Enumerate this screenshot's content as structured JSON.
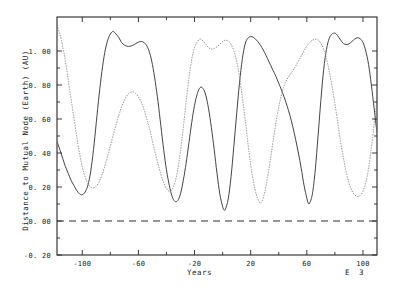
{
  "chart_data": {
    "type": "line",
    "title": "",
    "xlabel": "Years",
    "ylabel": "Distance to Mutual Node (Earth) (AU)",
    "x_exponent_label": "E  3",
    "xlim": [
      -118,
      110
    ],
    "ylim": [
      -0.2,
      1.2
    ],
    "xticks": [
      -100,
      -60,
      -20,
      20,
      60,
      100
    ],
    "xtick_labels": [
      "-100",
      "-60",
      "-20",
      "20",
      "60",
      "100"
    ],
    "yticks": [
      1.0,
      0.8,
      0.6,
      0.4,
      0.2,
      0.0,
      -0.2
    ],
    "ytick_labels": [
      "1. 00",
      "0. 80",
      "0. 60",
      "0. 40",
      "0. 20",
      "0. 00",
      "-0. 20"
    ],
    "grid": false,
    "legend": null,
    "reference_lines": [
      {
        "name": "zero-line",
        "axis": "horizontal",
        "value": 0.0,
        "style": "dashed"
      }
    ],
    "series": [
      {
        "name": "solid-curve",
        "style": "solid",
        "color": "#3a3a3a",
        "points": [
          [
            -118,
            0.47
          ],
          [
            -116,
            0.42
          ],
          [
            -114,
            0.37
          ],
          [
            -112,
            0.32
          ],
          [
            -110,
            0.28
          ],
          [
            -108,
            0.24
          ],
          [
            -106,
            0.21
          ],
          [
            -104,
            0.18
          ],
          [
            -102,
            0.16
          ],
          [
            -100,
            0.155
          ],
          [
            -98,
            0.17
          ],
          [
            -96,
            0.21
          ],
          [
            -94,
            0.29
          ],
          [
            -92,
            0.42
          ],
          [
            -90,
            0.58
          ],
          [
            -88,
            0.74
          ],
          [
            -86,
            0.88
          ],
          [
            -84,
            0.99
          ],
          [
            -82,
            1.06
          ],
          [
            -80,
            1.1
          ],
          [
            -78,
            1.115
          ],
          [
            -76,
            1.1
          ],
          [
            -74,
            1.08
          ],
          [
            -72,
            1.05
          ],
          [
            -70,
            1.035
          ],
          [
            -68,
            1.028
          ],
          [
            -66,
            1.028
          ],
          [
            -64,
            1.033
          ],
          [
            -62,
            1.043
          ],
          [
            -60,
            1.052
          ],
          [
            -58,
            1.056
          ],
          [
            -56,
            1.05
          ],
          [
            -54,
            1.03
          ],
          [
            -52,
            0.99
          ],
          [
            -50,
            0.92
          ],
          [
            -48,
            0.82
          ],
          [
            -46,
            0.7
          ],
          [
            -44,
            0.56
          ],
          [
            -42,
            0.42
          ],
          [
            -40,
            0.3
          ],
          [
            -38,
            0.21
          ],
          [
            -36,
            0.145
          ],
          [
            -34,
            0.115
          ],
          [
            -32,
            0.12
          ],
          [
            -30,
            0.16
          ],
          [
            -28,
            0.24
          ],
          [
            -26,
            0.34
          ],
          [
            -24,
            0.46
          ],
          [
            -22,
            0.58
          ],
          [
            -20,
            0.68
          ],
          [
            -18,
            0.75
          ],
          [
            -16,
            0.785
          ],
          [
            -14,
            0.78
          ],
          [
            -12,
            0.74
          ],
          [
            -10,
            0.66
          ],
          [
            -8,
            0.55
          ],
          [
            -6,
            0.42
          ],
          [
            -4,
            0.28
          ],
          [
            -2,
            0.16
          ],
          [
            0,
            0.085
          ],
          [
            1,
            0.065
          ],
          [
            2,
            0.07
          ],
          [
            4,
            0.13
          ],
          [
            6,
            0.26
          ],
          [
            8,
            0.44
          ],
          [
            10,
            0.63
          ],
          [
            12,
            0.81
          ],
          [
            14,
            0.95
          ],
          [
            16,
            1.04
          ],
          [
            18,
            1.075
          ],
          [
            20,
            1.085
          ],
          [
            22,
            1.08
          ],
          [
            24,
            1.065
          ],
          [
            26,
            1.045
          ],
          [
            28,
            1.02
          ],
          [
            30,
            0.99
          ],
          [
            32,
            0.955
          ],
          [
            34,
            0.92
          ],
          [
            36,
            0.885
          ],
          [
            38,
            0.85
          ],
          [
            40,
            0.81
          ],
          [
            42,
            0.77
          ],
          [
            44,
            0.725
          ],
          [
            46,
            0.675
          ],
          [
            48,
            0.62
          ],
          [
            50,
            0.555
          ],
          [
            52,
            0.48
          ],
          [
            54,
            0.4
          ],
          [
            56,
            0.31
          ],
          [
            58,
            0.21
          ],
          [
            60,
            0.135
          ],
          [
            61,
            0.105
          ],
          [
            62,
            0.105
          ],
          [
            64,
            0.16
          ],
          [
            66,
            0.3
          ],
          [
            68,
            0.5
          ],
          [
            70,
            0.71
          ],
          [
            72,
            0.89
          ],
          [
            74,
            1.01
          ],
          [
            76,
            1.075
          ],
          [
            78,
            1.1
          ],
          [
            80,
            1.105
          ],
          [
            82,
            1.09
          ],
          [
            84,
            1.065
          ],
          [
            86,
            1.045
          ],
          [
            88,
            1.038
          ],
          [
            90,
            1.042
          ],
          [
            92,
            1.055
          ],
          [
            94,
            1.07
          ],
          [
            96,
            1.078
          ],
          [
            98,
            1.072
          ],
          [
            100,
            1.05
          ],
          [
            102,
            1.0
          ],
          [
            104,
            0.92
          ],
          [
            106,
            0.8
          ],
          [
            108,
            0.66
          ],
          [
            110,
            0.52
          ],
          [
            112,
            0.4
          ],
          [
            114,
            0.3
          ],
          [
            116,
            0.235
          ],
          [
            118,
            0.2
          ],
          [
            120,
            0.195
          ]
        ]
      },
      {
        "name": "dotted-curve",
        "style": "dotted",
        "color": "#8c8c8c",
        "points": [
          [
            -118,
            1.15
          ],
          [
            -116,
            1.1
          ],
          [
            -114,
            1.03
          ],
          [
            -112,
            0.94
          ],
          [
            -110,
            0.83
          ],
          [
            -108,
            0.72
          ],
          [
            -106,
            0.61
          ],
          [
            -104,
            0.5
          ],
          [
            -102,
            0.4
          ],
          [
            -100,
            0.32
          ],
          [
            -98,
            0.26
          ],
          [
            -96,
            0.22
          ],
          [
            -94,
            0.2
          ],
          [
            -92,
            0.195
          ],
          [
            -90,
            0.205
          ],
          [
            -88,
            0.23
          ],
          [
            -86,
            0.27
          ],
          [
            -84,
            0.32
          ],
          [
            -82,
            0.38
          ],
          [
            -80,
            0.44
          ],
          [
            -78,
            0.505
          ],
          [
            -76,
            0.565
          ],
          [
            -74,
            0.62
          ],
          [
            -72,
            0.67
          ],
          [
            -70,
            0.71
          ],
          [
            -68,
            0.74
          ],
          [
            -66,
            0.755
          ],
          [
            -64,
            0.76
          ],
          [
            -62,
            0.75
          ],
          [
            -60,
            0.73
          ],
          [
            -58,
            0.7
          ],
          [
            -56,
            0.655
          ],
          [
            -54,
            0.6
          ],
          [
            -52,
            0.54
          ],
          [
            -50,
            0.47
          ],
          [
            -48,
            0.4
          ],
          [
            -46,
            0.335
          ],
          [
            -44,
            0.275
          ],
          [
            -42,
            0.225
          ],
          [
            -40,
            0.19
          ],
          [
            -38,
            0.175
          ],
          [
            -36,
            0.185
          ],
          [
            -34,
            0.225
          ],
          [
            -32,
            0.3
          ],
          [
            -30,
            0.41
          ],
          [
            -28,
            0.55
          ],
          [
            -26,
            0.7
          ],
          [
            -24,
            0.84
          ],
          [
            -22,
            0.95
          ],
          [
            -20,
            1.02
          ],
          [
            -18,
            1.055
          ],
          [
            -16,
            1.07
          ],
          [
            -14,
            1.06
          ],
          [
            -12,
            1.04
          ],
          [
            -10,
            1.02
          ],
          [
            -8,
            1.012
          ],
          [
            -6,
            1.015
          ],
          [
            -4,
            1.025
          ],
          [
            -2,
            1.04
          ],
          [
            0,
            1.055
          ],
          [
            2,
            1.063
          ],
          [
            4,
            1.058
          ],
          [
            6,
            1.04
          ],
          [
            8,
            1.0
          ],
          [
            10,
            0.94
          ],
          [
            12,
            0.85
          ],
          [
            14,
            0.73
          ],
          [
            16,
            0.6
          ],
          [
            18,
            0.46
          ],
          [
            20,
            0.33
          ],
          [
            22,
            0.23
          ],
          [
            24,
            0.155
          ],
          [
            26,
            0.115
          ],
          [
            27,
            0.105
          ],
          [
            28,
            0.115
          ],
          [
            30,
            0.17
          ],
          [
            32,
            0.255
          ],
          [
            34,
            0.36
          ],
          [
            36,
            0.47
          ],
          [
            38,
            0.58
          ],
          [
            40,
            0.67
          ],
          [
            42,
            0.745
          ],
          [
            44,
            0.8
          ],
          [
            46,
            0.835
          ],
          [
            48,
            0.86
          ],
          [
            50,
            0.885
          ],
          [
            52,
            0.91
          ],
          [
            54,
            0.94
          ],
          [
            56,
            0.97
          ],
          [
            58,
            1.0
          ],
          [
            60,
            1.03
          ],
          [
            62,
            1.05
          ],
          [
            64,
            1.063
          ],
          [
            66,
            1.07
          ],
          [
            68,
            1.065
          ],
          [
            70,
            1.045
          ],
          [
            72,
            1.01
          ],
          [
            74,
            0.955
          ],
          [
            76,
            0.88
          ],
          [
            78,
            0.79
          ],
          [
            80,
            0.69
          ],
          [
            82,
            0.58
          ],
          [
            84,
            0.47
          ],
          [
            86,
            0.375
          ],
          [
            88,
            0.29
          ],
          [
            90,
            0.225
          ],
          [
            92,
            0.18
          ],
          [
            94,
            0.155
          ],
          [
            96,
            0.145
          ],
          [
            98,
            0.15
          ],
          [
            100,
            0.175
          ],
          [
            102,
            0.225
          ],
          [
            104,
            0.31
          ],
          [
            106,
            0.43
          ],
          [
            108,
            0.57
          ],
          [
            110,
            0.71
          ],
          [
            112,
            0.84
          ],
          [
            114,
            0.95
          ],
          [
            116,
            1.03
          ],
          [
            118,
            1.09
          ],
          [
            120,
            1.12
          ]
        ]
      }
    ]
  },
  "axes": {
    "frame": {
      "left": 57,
      "top": 17,
      "right": 377,
      "bottom": 255
    }
  }
}
